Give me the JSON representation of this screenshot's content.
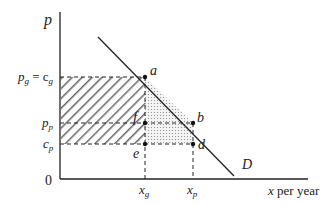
{
  "diagram": {
    "type": "economics-monopoly-regulation",
    "axes": {
      "y_label": "p",
      "x_label": "x per year",
      "origin_label": "0"
    },
    "y_ticks": [
      {
        "id": "pg",
        "label": "p",
        "sub": "g",
        "eq": " = c",
        "eq_sub": "g"
      },
      {
        "id": "pp",
        "label": "p",
        "sub": "p"
      },
      {
        "id": "cp",
        "label": "c",
        "sub": "p"
      }
    ],
    "x_ticks": [
      {
        "id": "xg",
        "label": "x",
        "sub": "g"
      },
      {
        "id": "xp",
        "label": "x",
        "sub": "p"
      }
    ],
    "points": [
      {
        "id": "a",
        "label": "a"
      },
      {
        "id": "b",
        "label": "b"
      },
      {
        "id": "f",
        "label": "f"
      },
      {
        "id": "e",
        "label": "e"
      },
      {
        "id": "d",
        "label": "d"
      }
    ],
    "curve_label": "D",
    "regions": [
      {
        "id": "hatched",
        "description": "rectangle from c_p to p_g, 0 to x_g",
        "pattern": "diagonal-hatch"
      },
      {
        "id": "dotted",
        "description": "area a-b-d-e",
        "pattern": "dots"
      }
    ],
    "colors": {
      "line": "#222222",
      "hatch": "#555555",
      "dots": "#777777"
    }
  }
}
